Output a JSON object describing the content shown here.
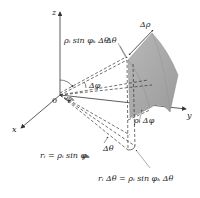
{
  "diagram": {
    "type": "spherical-coordinate-volume-element",
    "axes": {
      "z": "z",
      "x": "x",
      "y": "y",
      "origin": "0"
    },
    "labels": {
      "top_arc": "ρᵢ sin φₖ Δθ",
      "delta_rho": "Δρ",
      "delta_theta_top": "Δθ",
      "phi_k": "φₖ",
      "delta_phi": "Δφ",
      "rho_delta_phi": "ρᵢ Δφ",
      "delta_theta_bottom": "Δθ",
      "phi_k_bottom": "φₖ",
      "r_i_eq": "rᵢ = ρᵢ sin φₖ",
      "bottom_eq": "rᵢ Δθ = ρᵢ sin φₖ Δθ"
    },
    "colors": {
      "wedge_fill": "#a8a8a8",
      "wedge_edge": "#8a8a8a",
      "line": "#333333"
    }
  }
}
